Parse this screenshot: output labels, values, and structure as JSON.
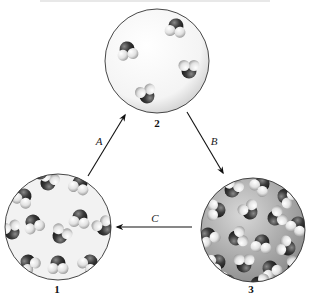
{
  "figure": {
    "type": "phase-change cycle diagram",
    "states": [
      {
        "id": "1",
        "label": "1",
        "description": "ordered lattice of water molecules (solid)",
        "cx": 58,
        "cy": 227,
        "r": 53
      },
      {
        "id": "2",
        "label": "2",
        "description": "few widely spaced water molecules (gas)",
        "cx": 157,
        "cy": 61,
        "r": 52
      },
      {
        "id": "3",
        "label": "3",
        "description": "densely packed disordered water molecules (liquid)",
        "cx": 253,
        "cy": 230,
        "r": 52
      }
    ],
    "arrows": [
      {
        "id": "A",
        "label": "A",
        "from": "1",
        "to": "2"
      },
      {
        "id": "B",
        "label": "B",
        "from": "2",
        "to": "3"
      },
      {
        "id": "C",
        "label": "C",
        "from": "3",
        "to": "1"
      }
    ],
    "colors": {
      "oxygen": "#2e2e2e",
      "hydrogen": "#e6e6e6",
      "circle_outline": "#333333",
      "arrow": "#111111",
      "background": "#ffffff"
    }
  }
}
